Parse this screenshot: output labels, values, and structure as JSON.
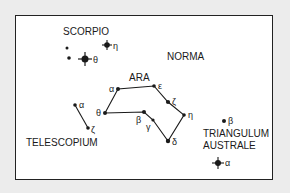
{
  "constellations": {
    "scorpio": "SCORPIO",
    "norma": "NORMA",
    "ara": "ARA",
    "telescopium": "TELESCOPIUM",
    "triangulum_line1": "TRIANGULUM",
    "triangulum_line2": "AUSTRALE"
  },
  "stars": {
    "scorpio_eta": "η",
    "scorpio_theta": "θ",
    "ara_alpha": "α",
    "ara_epsilon": "ε",
    "ara_zeta": "ζ",
    "ara_eta": "η",
    "ara_delta": "δ",
    "ara_gamma": "γ",
    "ara_beta": "β",
    "ara_theta": "θ",
    "tel_alpha": "α",
    "tel_zeta": "ζ",
    "tri_beta": "β",
    "tri_alpha": "α"
  },
  "colors": {
    "ink": "#1a1a1a",
    "paper": "#ffffff",
    "background": "#ececec"
  }
}
